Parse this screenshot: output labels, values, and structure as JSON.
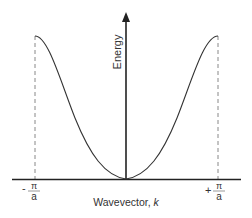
{
  "diagram": {
    "y_axis_label": "Energy",
    "x_axis_label": "Wavevector, ",
    "x_axis_symbol": "k",
    "left_bound": {
      "sign": "-",
      "numerator": "π",
      "denominator": "a"
    },
    "right_bound": {
      "sign": "+",
      "numerator": "π",
      "denominator": "a"
    },
    "colors": {
      "line": "#222222",
      "dashed": "#777777",
      "text": "#333333"
    }
  }
}
